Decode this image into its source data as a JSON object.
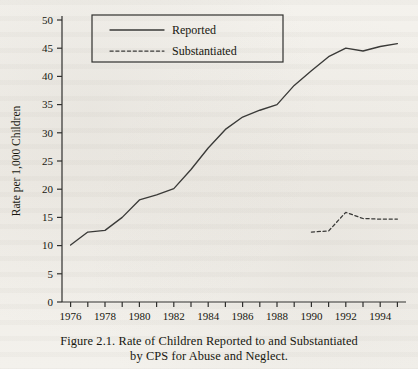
{
  "figure": {
    "caption_line_1": "Figure 2.1.    Rate of Children Reported to and Substantiated",
    "caption_line_2": "by CPS for Abuse and Neglect."
  },
  "legend": {
    "position": "top-left",
    "entries": [
      {
        "label": "Reported",
        "style": "solid"
      },
      {
        "label": "Substantiated",
        "style": "dashed"
      }
    ]
  },
  "axes": {
    "y_label": "Rate per 1,000 Children",
    "y_ticks": [
      "0",
      "5",
      "10",
      "15",
      "20",
      "25",
      "30",
      "35",
      "40",
      "45",
      "50"
    ],
    "x_ticks_labeled": [
      "1976",
      "1978",
      "1980",
      "1982",
      "1984",
      "1986",
      "1988",
      "1990",
      "1992",
      "1994"
    ]
  },
  "colors": {
    "line": "#3a3a38",
    "axis": "#30302e",
    "text": "#17170f",
    "background": "#f2f0eb"
  },
  "chart_data": {
    "type": "line",
    "xlabel": "",
    "ylabel": "Rate per 1,000 Children",
    "xlim": [
      1975.5,
      1995.5
    ],
    "ylim": [
      0,
      50
    ],
    "ytick_step": 5,
    "xtick_step": 1,
    "xtick_label_step": 2,
    "grid": false,
    "legend_position": "upper left",
    "x": [
      1976,
      1977,
      1978,
      1979,
      1980,
      1981,
      1982,
      1983,
      1984,
      1985,
      1986,
      1987,
      1988,
      1989,
      1990,
      1991,
      1992,
      1993,
      1994,
      1995
    ],
    "series": [
      {
        "name": "Reported",
        "style": "solid",
        "x": [
          1976,
          1977,
          1978,
          1979,
          1980,
          1981,
          1982,
          1983,
          1984,
          1985,
          1986,
          1987,
          1988,
          1989,
          1990,
          1991,
          1992,
          1993,
          1994,
          1995
        ],
        "values": [
          10.1,
          12.4,
          12.7,
          15.0,
          18.1,
          19.0,
          20.1,
          23.5,
          27.3,
          30.6,
          32.8,
          34.0,
          35.0,
          38.4,
          41.0,
          43.5,
          45.0,
          44.5,
          45.3,
          45.8
        ]
      },
      {
        "name": "Substantiated",
        "style": "dashed",
        "x": [
          1990,
          1991,
          1992,
          1993,
          1994,
          1995
        ],
        "values": [
          12.4,
          12.6,
          15.9,
          14.8,
          14.7,
          14.7
        ]
      }
    ]
  }
}
